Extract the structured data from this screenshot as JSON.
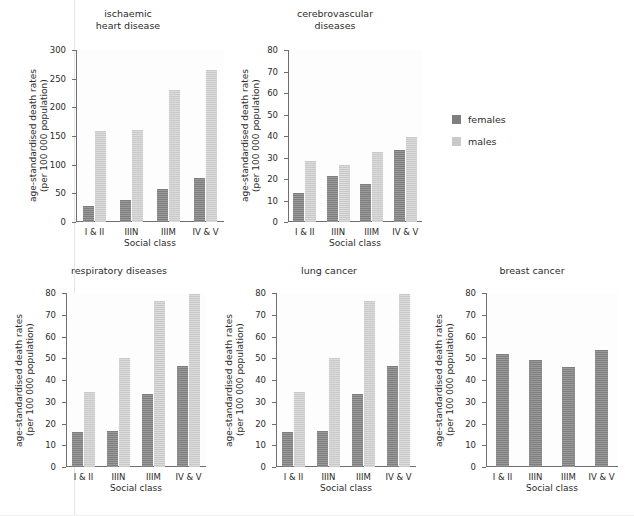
{
  "legend": {
    "position": "right-of-panel-2",
    "entries": [
      {
        "label": "females",
        "color": "#7e7e7e"
      },
      {
        "label": "males",
        "color": "#c9c9c9"
      }
    ]
  },
  "axis_titles": {
    "y": "age-standardised death rates\n(per 100 000 population)",
    "x": "Social class"
  },
  "chart_data": [
    {
      "type": "bar",
      "title": "ischaemic\nheart disease",
      "categories": [
        "I & II",
        "IIIN",
        "IIIM",
        "IV & V"
      ],
      "series": [
        {
          "name": "females",
          "color": "#7e7e7e",
          "values": [
            28,
            38,
            58,
            77
          ]
        },
        {
          "name": "males",
          "color": "#c9c9c9",
          "values": [
            158,
            160,
            230,
            265
          ]
        }
      ],
      "xlabel": "Social class",
      "ylabel": "age-standardised death rates\n(per 100 000 population)",
      "ylim": [
        0,
        300
      ],
      "yticks": [
        0,
        50,
        100,
        150,
        200,
        250,
        300
      ],
      "grid": false
    },
    {
      "type": "bar",
      "title": "cerebrovascular\ndiseases",
      "categories": [
        "I & II",
        "IIIN",
        "IIIM",
        "IV & V"
      ],
      "series": [
        {
          "name": "females",
          "color": "#7e7e7e",
          "values": [
            13.5,
            21.5,
            17.5,
            33.5
          ]
        },
        {
          "name": "males",
          "color": "#c9c9c9",
          "values": [
            28.5,
            26.5,
            32.5,
            39.5
          ]
        }
      ],
      "xlabel": "Social class",
      "ylabel": "age-standardised death rates\n(per 100 000 population)",
      "ylim": [
        0,
        80
      ],
      "yticks": [
        0,
        10,
        20,
        30,
        40,
        50,
        60,
        70,
        80
      ],
      "grid": false
    },
    {
      "type": "bar",
      "title": "respiratory diseases",
      "categories": [
        "I & II",
        "IIIN",
        "IIIM",
        "IV & V"
      ],
      "series": [
        {
          "name": "females",
          "color": "#7e7e7e",
          "values": [
            16,
            16.5,
            33.5,
            46.5
          ]
        },
        {
          "name": "males",
          "color": "#c9c9c9",
          "values": [
            34.5,
            50,
            76.5,
            79.5
          ]
        }
      ],
      "xlabel": "Social class",
      "ylabel": "age-standardised death rates\n(per 100 000 population)",
      "ylim": [
        0,
        80
      ],
      "yticks": [
        0,
        10,
        20,
        30,
        40,
        50,
        60,
        70,
        80
      ],
      "grid": false
    },
    {
      "type": "bar",
      "title": "lung cancer",
      "categories": [
        "I & II",
        "IIIN",
        "IIIM",
        "IV & V"
      ],
      "series": [
        {
          "name": "females",
          "color": "#7e7e7e",
          "values": [
            16,
            16.5,
            33.5,
            46.5
          ]
        },
        {
          "name": "males",
          "color": "#c9c9c9",
          "values": [
            34.5,
            50,
            76.5,
            79.5
          ]
        }
      ],
      "xlabel": "Social class",
      "ylabel": "age-standardised death rates\n(per 100 000 population)",
      "ylim": [
        0,
        80
      ],
      "yticks": [
        0,
        10,
        20,
        30,
        40,
        50,
        60,
        70,
        80
      ],
      "grid": false
    },
    {
      "type": "bar",
      "title": "breast cancer",
      "categories": [
        "I & II",
        "IIIN",
        "IIIM",
        "IV & V"
      ],
      "series": [
        {
          "name": "females",
          "color": "#7e7e7e",
          "values": [
            52,
            49,
            46,
            54
          ]
        }
      ],
      "xlabel": "Social class",
      "ylabel": "age-standardised death rates\n(per 100 000 population)",
      "ylim": [
        0,
        80
      ],
      "yticks": [
        0,
        10,
        20,
        30,
        40,
        50,
        60,
        70,
        80
      ],
      "grid": false
    }
  ]
}
